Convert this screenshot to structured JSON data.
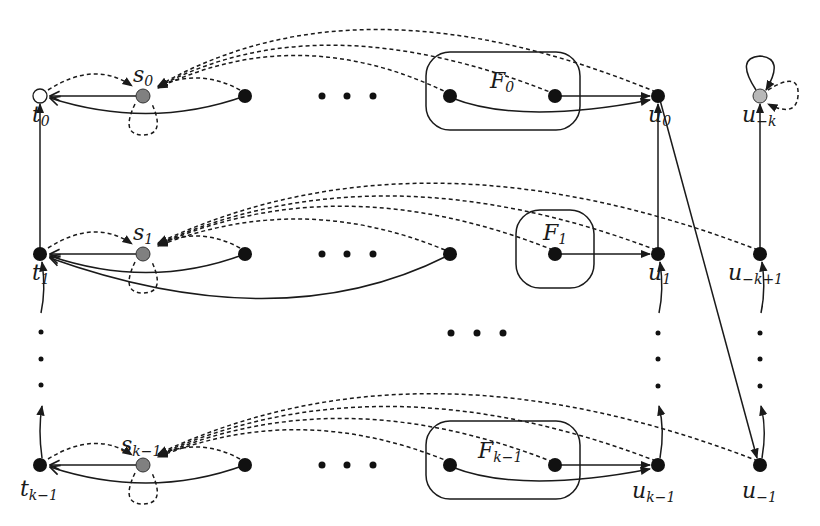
{
  "diagram": {
    "colors": {
      "edge": "#1a1a1a",
      "black_node": "#111111",
      "gray_node": "#808080",
      "light_gray_node": "#b8b8b8",
      "white_node": "#ffffff",
      "background": "#ffffff"
    },
    "labels": {
      "t0": {
        "base": "t",
        "sub": "0"
      },
      "s0": {
        "base": "s",
        "sub": "0"
      },
      "F0": {
        "base": "F",
        "sub": "0"
      },
      "u0": {
        "base": "u",
        "sub": "0"
      },
      "u_minus_k": {
        "base": "u",
        "sub": "−k"
      },
      "t1": {
        "base": "t",
        "sub": "1"
      },
      "s1": {
        "base": "s",
        "sub": "1"
      },
      "F1": {
        "base": "F",
        "sub": "1"
      },
      "u1": {
        "base": "u",
        "sub": "1"
      },
      "u_minus_k_plus_1": {
        "base": "u",
        "sub": "−k+1"
      },
      "tk1": {
        "base": "t",
        "sub": "k−1"
      },
      "sk1": {
        "base": "s",
        "sub": "k−1"
      },
      "Fk1": {
        "base": "F",
        "sub": "k−1"
      },
      "uk1": {
        "base": "u",
        "sub": "k−1"
      },
      "u_minus_1": {
        "base": "u",
        "sub": "−1"
      }
    },
    "rows": [
      {
        "name": "row-0",
        "y": 96,
        "t": "t0",
        "s": "s0",
        "F": "F0",
        "u": "u0",
        "right": "u_minus_k",
        "t_style": "white",
        "right_style": "light-gray"
      },
      {
        "name": "row-1",
        "y": 254,
        "t": "t1",
        "s": "s1",
        "F": "F1",
        "u": "u1",
        "right": "u_minus_k_plus_1",
        "t_style": "black",
        "right_style": "black"
      },
      {
        "name": "row-k-1",
        "y": 465,
        "t": "tk1",
        "s": "sk1",
        "F": "Fk1",
        "u": "uk1",
        "right": "u_minus_1",
        "t_style": "black",
        "right_style": "black"
      }
    ],
    "ellipsis": "• • •"
  }
}
